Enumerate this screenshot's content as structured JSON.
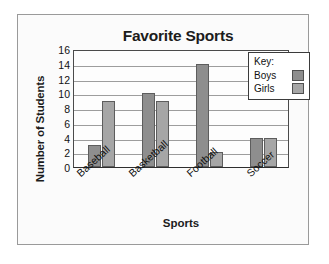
{
  "figure": {
    "title": "Favorite Sports"
  },
  "chart_data": {
    "type": "bar",
    "title": "Favorite Sports",
    "xlabel": "Sports",
    "ylabel": "Number of Students",
    "categories": [
      "Baseball",
      "Basketball",
      "Football",
      "Soccer"
    ],
    "series": [
      {
        "name": "Boys",
        "values": [
          3,
          10,
          14,
          4
        ],
        "color": "#8e8e8e"
      },
      {
        "name": "Girls",
        "values": [
          9,
          9,
          2,
          4
        ],
        "color": "#a6a6a6"
      }
    ],
    "ylim": [
      0,
      16
    ],
    "ytick_labels": [
      "0",
      "2",
      "4",
      "6",
      "8",
      "10",
      "12",
      "14",
      "16"
    ],
    "ytick_values": [
      0,
      2,
      4,
      6,
      8,
      10,
      12,
      14,
      16
    ],
    "grid": true,
    "grid_axis": "y",
    "legend_position": "top-right",
    "legend_title": "Key:",
    "xtick_rotation": -42
  },
  "legend": {
    "title": "Key:",
    "entries": [
      {
        "label": "Boys",
        "color": "#8e8e8e"
      },
      {
        "label": "Girls",
        "color": "#a6a6a6"
      }
    ]
  }
}
